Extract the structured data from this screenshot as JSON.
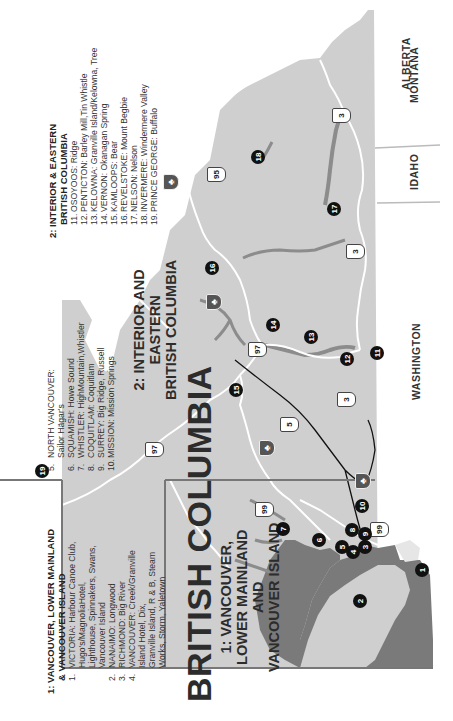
{
  "map": {
    "title": "BRITISH COLUMBIA",
    "colors": {
      "land_bc": "#cfcfcf",
      "water": "#7a7a7a",
      "lakes": "#8c8c8c",
      "outside": "#ffffff",
      "roads_minor": "#ffffff",
      "roads_major": "#111111",
      "region_divider": "#777777",
      "marker_fill": "#111111"
    },
    "neighbors": {
      "alberta": "ALBERTA",
      "montana": "MONTANA",
      "idaho": "IDAHO",
      "washington": "WASHINGTON"
    },
    "region_labels": {
      "region1": [
        "1: VANCOUVER,",
        "LOWER MAINLAND",
        "AND",
        "VANCOUVER ISLAND"
      ],
      "region2": [
        "2: INTERIOR AND",
        "EASTERN",
        "BRITISH COLUMBIA"
      ]
    },
    "highways": [
      {
        "id": "97",
        "label": "97"
      },
      {
        "id": "99",
        "label": "99"
      },
      {
        "id": "5",
        "label": "5"
      },
      {
        "id": "3a",
        "label": "3"
      },
      {
        "id": "3b",
        "label": "3"
      },
      {
        "id": "3c",
        "label": "3"
      },
      {
        "id": "95",
        "label": "95"
      },
      {
        "id": "99b",
        "label": "99"
      }
    ],
    "markers": [
      "1",
      "2",
      "3",
      "4",
      "5",
      "6",
      "7",
      "8",
      "9",
      "10",
      "11",
      "12",
      "13",
      "14",
      "15",
      "16",
      "17",
      "18",
      "19"
    ]
  },
  "legend": {
    "region1": {
      "title_lines": [
        "1: VANCOUVER, LOWER MAINLAND",
        "& VANCOUVER ISLAND"
      ],
      "entries": [
        {
          "num": "1.",
          "lines": [
            "VICTORIA: Harbour Canoe Club,",
            "Hugo's/MagnoliaHotel,",
            "Lighthouse, Spinnakers, Swans,",
            "Vancouver Island"
          ]
        },
        {
          "num": "2.",
          "lines": [
            "NANAIMO: Longwood"
          ]
        },
        {
          "num": "3.",
          "lines": [
            "RICHMOND: Big River"
          ]
        },
        {
          "num": "4.",
          "lines": [
            "VANCOUVER: Creek/Granville",
            "Island Hotel, Dix,",
            "Granville Island, R & B, Steam",
            "Works, Storm, Yaletown"
          ]
        }
      ]
    },
    "region1_cont": {
      "entries": [
        {
          "num": "5.",
          "lines": [
            "NORTH VANCOUVER:",
            "Sailor Hägar's"
          ]
        },
        {
          "num": "6.",
          "lines": [
            "SQUAMISH: Howe Sound"
          ]
        },
        {
          "num": "7.",
          "lines": [
            "WHISTLER: HighMountain,Whistler"
          ]
        },
        {
          "num": "8.",
          "lines": [
            "COQUITLAM: Coquitlam"
          ]
        },
        {
          "num": "9.",
          "lines": [
            "SURREY: Big Ridge, Russell"
          ]
        },
        {
          "num": "10.",
          "lines": [
            "MISSION: Mission Springs"
          ]
        }
      ]
    },
    "region2": {
      "title_lines": [
        "2: INTERIOR & EASTERN",
        "BRITISH COLUMBIA"
      ],
      "entries": [
        {
          "num": "11.",
          "lines": [
            "OSOYOOS: Ridge"
          ]
        },
        {
          "num": "12.",
          "lines": [
            "PENTICTON: Barley Mill,Tin Whistle"
          ]
        },
        {
          "num": "13.",
          "lines": [
            "KELOWNA: Granville Island/Kelowna, Tree"
          ]
        },
        {
          "num": "14.",
          "lines": [
            "VERNON: Okanagan Spring"
          ]
        },
        {
          "num": "15.",
          "lines": [
            "KAMLOOPS: Bear"
          ]
        },
        {
          "num": "16.",
          "lines": [
            "REVELSTOKE: Mount Begbie"
          ]
        },
        {
          "num": "17.",
          "lines": [
            "NELSON: Nelson"
          ]
        },
        {
          "num": "18.",
          "lines": [
            "INVERMERE: Windermere Valley"
          ]
        },
        {
          "num": "19.",
          "lines": [
            "PRINCE GEORGE: Buffalo"
          ]
        }
      ]
    }
  }
}
